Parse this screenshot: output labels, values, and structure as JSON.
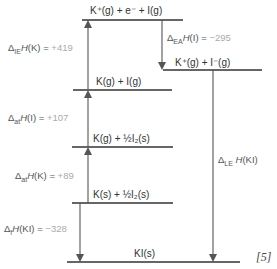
{
  "diagram": {
    "type": "Born-Haber cycle",
    "compound": "KI",
    "levels": [
      {
        "id": "top",
        "label": "K⁺(g) + e⁻ + I(g)"
      },
      {
        "id": "ions",
        "label": "K⁺(g) + I⁻(g)"
      },
      {
        "id": "atoms",
        "label": "K(g) + I(g)"
      },
      {
        "id": "kgas",
        "label": "K(g) + ½I₂(s)"
      },
      {
        "id": "elements",
        "label": "K(s) + ½I₂(s)"
      },
      {
        "id": "product",
        "label": "KI(s)"
      }
    ],
    "steps": [
      {
        "id": "ie",
        "symbol": "Δ",
        "sub": "IE",
        "func": "H",
        "species": "(K)",
        "eq": " = ",
        "value": "+419",
        "direction": "up"
      },
      {
        "id": "ea",
        "symbol": "Δ",
        "sub": "EA",
        "func": "H",
        "species": "(I)",
        "eq": " = ",
        "value": "−295",
        "direction": "down"
      },
      {
        "id": "at_i",
        "symbol": "Δ",
        "sub": "at",
        "func": "H",
        "species": "(I)",
        "eq": " = ",
        "value": "+107",
        "direction": "up"
      },
      {
        "id": "at_k",
        "symbol": "Δ",
        "sub": "at",
        "func": "H",
        "species": "(K)",
        "eq": " = ",
        "value": "+89",
        "direction": "up"
      },
      {
        "id": "f",
        "symbol": "Δ",
        "sub": "f",
        "func": "H",
        "species": "(KI)",
        "eq": " = ",
        "value": "−328",
        "direction": "down"
      },
      {
        "id": "le",
        "symbol": "Δ",
        "sub": "LE",
        "func": "H",
        "species": "(KI)",
        "eq": "",
        "value": "",
        "direction": "down"
      }
    ],
    "marks": "[5]"
  }
}
